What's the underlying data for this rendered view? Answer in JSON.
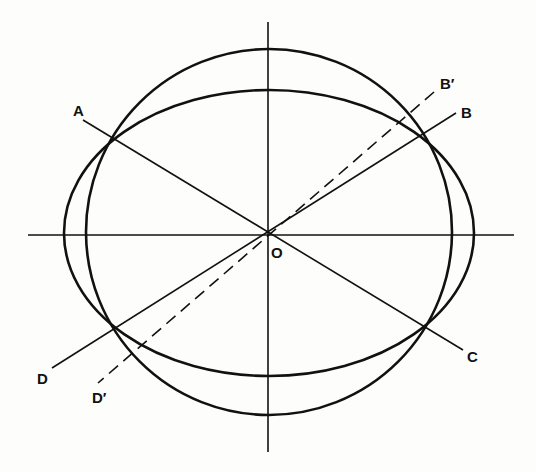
{
  "figure": {
    "type": "geometric-diagram",
    "stroke_color": "#111111",
    "background": "#fdfdfc"
  },
  "center": {
    "label": "O",
    "x": 268,
    "y": 234
  },
  "axes": {
    "horizontal": {
      "x1": 28,
      "y1": 235,
      "x2": 514,
      "y2": 235
    },
    "vertical": {
      "x1": 268,
      "y1": 22,
      "x2": 268,
      "y2": 452
    }
  },
  "shapes": {
    "circle": {
      "cx": 269,
      "cy": 232,
      "r": 183
    },
    "ellipse": {
      "cx": 269,
      "cy": 233,
      "rx": 205,
      "ry": 143
    }
  },
  "lines": [
    {
      "id": "AC",
      "x1": 83,
      "y1": 120,
      "x2": 463,
      "y2": 350,
      "dashed": false
    },
    {
      "id": "BD",
      "x1": 456,
      "y1": 113,
      "x2": 52,
      "y2": 368,
      "dashed": false
    },
    {
      "id": "B'D'",
      "x1": 434,
      "y1": 92,
      "x2": 98,
      "y2": 383,
      "dashed": true
    }
  ],
  "labels": {
    "A": "A",
    "B": "B",
    "B_prime": "B′",
    "C": "C",
    "D": "D",
    "D_prime": "D′",
    "O": "O"
  }
}
